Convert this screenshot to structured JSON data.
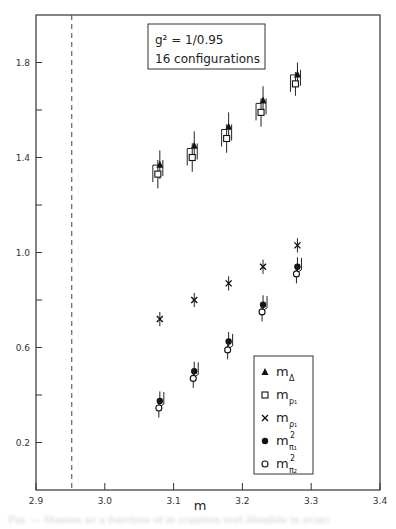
{
  "chart_data": {
    "type": "scatter",
    "title": "",
    "xlabel": "m",
    "ylabel": "",
    "xlim": [
      2.9,
      3.4
    ],
    "ylim": [
      0.0,
      2.0
    ],
    "xticks": [
      2.9,
      3.0,
      3.1,
      3.2,
      3.3,
      3.4
    ],
    "xtick_labels": [
      "2.9",
      "3.0",
      "3.1",
      "3.2",
      "3.3",
      "3.4"
    ],
    "yticks": [
      0.2,
      0.4,
      0.6,
      0.8,
      1.0,
      1.2,
      1.4,
      1.6,
      1.8
    ],
    "ytick_labels": [
      "0.2",
      "",
      "0.6",
      "",
      "1.0",
      "",
      "1.4",
      "",
      "1.8"
    ],
    "grid": false,
    "reference_line": {
      "style": "dashed",
      "orientation": "vertical",
      "x": 2.952
    },
    "annotation_box": {
      "lines": [
        "g² = 1/0.95",
        "16 configurations"
      ]
    },
    "legend_position": "lower right",
    "x": [
      3.08,
      3.13,
      3.18,
      3.23,
      3.28
    ],
    "series": [
      {
        "name": "m_Δ",
        "legend_main": "m",
        "legend_sub": "Δ",
        "legend_sup": "",
        "marker": "triangle-filled",
        "values": [
          1.37,
          1.45,
          1.53,
          1.64,
          1.75
        ],
        "err": [
          0.06,
          0.06,
          0.06,
          0.06,
          0.05
        ]
      },
      {
        "name": "m_ρ1",
        "legend_main": "m",
        "legend_sub": "p₁",
        "legend_sup": "",
        "marker": "square-open",
        "values": [
          1.33,
          1.4,
          1.48,
          1.59,
          1.71
        ],
        "err": [
          0.06,
          0.06,
          0.06,
          0.06,
          0.05
        ]
      },
      {
        "name": "m_ρ1 (x)",
        "legend_main": "m",
        "legend_sub": "ρ₁",
        "legend_sup": "",
        "marker": "x",
        "values": [
          0.72,
          0.8,
          0.87,
          0.94,
          1.03
        ],
        "err": [
          0.03,
          0.03,
          0.03,
          0.03,
          0.03
        ]
      },
      {
        "name": "m²_π1",
        "legend_main": "m",
        "legend_sub": "π₁",
        "legend_sup": "2",
        "marker": "circle-filled",
        "values": [
          0.375,
          0.5,
          0.625,
          0.78,
          0.94
        ],
        "err": [
          0.04,
          0.04,
          0.04,
          0.04,
          0.04
        ]
      },
      {
        "name": "m²_π2",
        "legend_main": "m",
        "legend_sub": "π₂",
        "legend_sup": "2",
        "marker": "circle-open",
        "values": [
          0.345,
          0.47,
          0.59,
          0.75,
          0.91
        ],
        "err": [
          0.04,
          0.04,
          0.04,
          0.04,
          0.04
        ]
      }
    ]
  },
  "caption": "Fig. — Masses as a function of m (caption text illegible in scan)"
}
